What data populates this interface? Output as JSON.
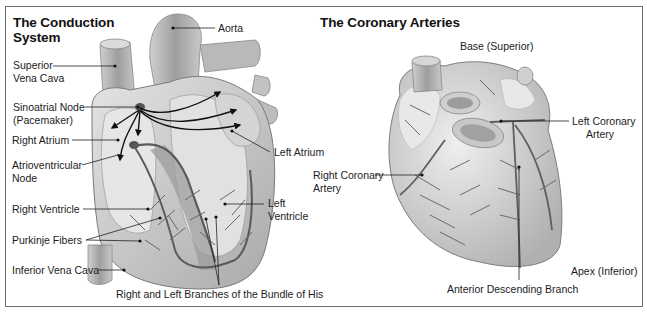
{
  "panels": [
    {
      "title_line1": "The Conduction",
      "title_line2": "System",
      "labels": {
        "aorta": "Aorta",
        "superior_vena_cava_1": "Superior",
        "superior_vena_cava_2": "Vena Cava",
        "sinoatrial_node_1": "Sinoatrial Node",
        "sinoatrial_node_2": "(Pacemaker)",
        "right_atrium": "Right Atrium",
        "atrioventricular_node_1": "Atrioventricular",
        "atrioventricular_node_2": "Node",
        "left_atrium": "Left Atrium",
        "right_ventricle": "Right Ventricle",
        "left_ventricle_1": "Left",
        "left_ventricle_2": "Ventricle",
        "purkinje_fibers": "Purkinje Fibers",
        "inferior_vena_cava": "Inferior Vena Cava",
        "bundle_of_his": "Right and Left Branches of the Bundle of His"
      }
    },
    {
      "title": "The Coronary Arteries",
      "labels": {
        "base": "Base (Superior)",
        "left_coronary_1": "Left Coronary",
        "left_coronary_2": "Artery",
        "right_coronary_1": "Right Coronary",
        "right_coronary_2": "Artery",
        "apex": "Apex (Inferior)",
        "anterior_descending": "Anterior Descending Branch"
      }
    }
  ],
  "colors": {
    "frame": "#6e6e6e",
    "tissue_light": "#d9d9d9",
    "tissue_mid": "#b5b5b5",
    "tissue_dark": "#8a8a8a",
    "vessel": "#5a5a5a",
    "leader": "#222222"
  }
}
